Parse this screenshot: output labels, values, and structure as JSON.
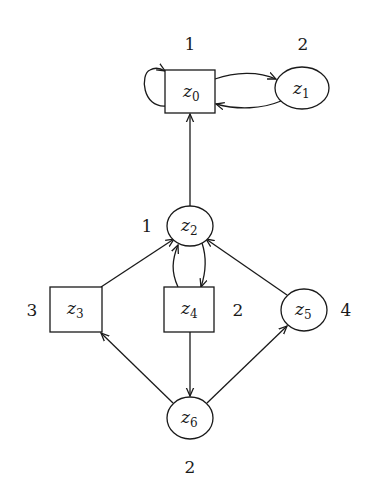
{
  "diagram": {
    "type": "parity-game-graph",
    "nodes": [
      {
        "id": "z0",
        "base": "z",
        "sub": "0",
        "shape": "box",
        "priority": "1"
      },
      {
        "id": "z1",
        "base": "z",
        "sub": "1",
        "shape": "ellipse",
        "priority": "2"
      },
      {
        "id": "z2",
        "base": "z",
        "sub": "2",
        "shape": "ellipse",
        "priority": "1"
      },
      {
        "id": "z3",
        "base": "z",
        "sub": "3",
        "shape": "box",
        "priority": "3"
      },
      {
        "id": "z4",
        "base": "z",
        "sub": "4",
        "shape": "box",
        "priority": "2"
      },
      {
        "id": "z5",
        "base": "z",
        "sub": "5",
        "shape": "ellipse",
        "priority": "4"
      },
      {
        "id": "z6",
        "base": "z",
        "sub": "6",
        "shape": "ellipse",
        "priority": "2"
      }
    ],
    "edges": [
      {
        "from": "z0",
        "to": "z0",
        "kind": "self-loop"
      },
      {
        "from": "z0",
        "to": "z1"
      },
      {
        "from": "z1",
        "to": "z0"
      },
      {
        "from": "z2",
        "to": "z0"
      },
      {
        "from": "z4",
        "to": "z2"
      },
      {
        "from": "z2",
        "to": "z4"
      },
      {
        "from": "z3",
        "to": "z2"
      },
      {
        "from": "z5",
        "to": "z2"
      },
      {
        "from": "z4",
        "to": "z6"
      },
      {
        "from": "z6",
        "to": "z3"
      },
      {
        "from": "z6",
        "to": "z5"
      }
    ],
    "colors": {
      "stroke": "#1a1a1a",
      "background": "#ffffff"
    }
  }
}
